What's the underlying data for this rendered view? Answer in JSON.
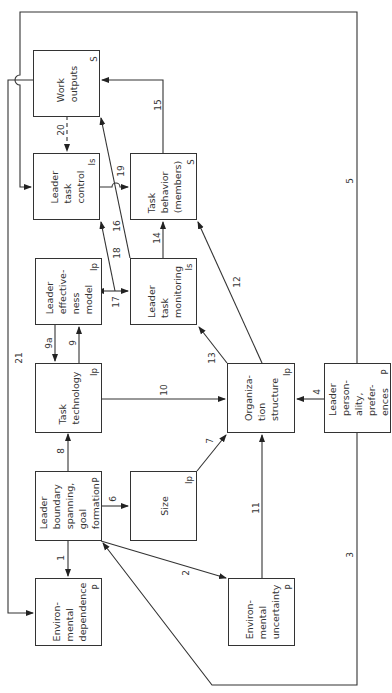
{
  "diagram": {
    "orientation": "rotated 90 degrees counter-clockwise (text reads bottom to top)",
    "nodes": [
      {
        "id": "work_outputs",
        "label": "Work\noutputs",
        "tag": "S"
      },
      {
        "id": "leader_task_control",
        "label": "Leader\ntask\ncontrol",
        "tag": "Is"
      },
      {
        "id": "task_behavior",
        "label": "Task\nbehavior\n(members)",
        "tag": "S"
      },
      {
        "id": "leader_effectiveness_model",
        "label": "Leader\neffective-\nness\nmodel",
        "tag": "Ip"
      },
      {
        "id": "leader_task_monitoring",
        "label": "Leader\ntask\nmonitoring",
        "tag": "Is"
      },
      {
        "id": "task_technology",
        "label": "Task\ntechnology",
        "tag": "Ip"
      },
      {
        "id": "organization_structure",
        "label": "Organiza-\ntion\nstructure",
        "tag": "Ip"
      },
      {
        "id": "leader_personality",
        "label": "Leader\nperson-\nality,\nprefer-\nences",
        "tag": "P"
      },
      {
        "id": "leader_boundary_spanning",
        "label": "Leader\nboundary\nspanning,\ngoal\nformation",
        "tag": "P"
      },
      {
        "id": "size",
        "label": "Size",
        "tag": "Ip"
      },
      {
        "id": "environmental_dependence",
        "label": "Environ-\nmental\ndependence",
        "tag": "P"
      },
      {
        "id": "environmental_uncertainty",
        "label": "Environ-\nmental\nuncertainty",
        "tag": "P"
      }
    ],
    "edges": [
      {
        "num": "1",
        "from": "leader_boundary_spanning",
        "to": "environmental_dependence"
      },
      {
        "num": "2",
        "from": "leader_boundary_spanning",
        "to": "environmental_uncertainty"
      },
      {
        "num": "3",
        "from": "leader_personality",
        "to": "leader_boundary_spanning"
      },
      {
        "num": "4",
        "from": "leader_personality",
        "to": "organization_structure"
      },
      {
        "num": "5",
        "from": "leader_personality",
        "to": "leader_task_control"
      },
      {
        "num": "6",
        "from": "leader_boundary_spanning",
        "to": "size"
      },
      {
        "num": "7",
        "from": "size",
        "to": "organization_structure"
      },
      {
        "num": "8",
        "from": "leader_boundary_spanning",
        "to": "task_technology"
      },
      {
        "num": "9",
        "from": "task_technology",
        "to": "leader_effectiveness_model"
      },
      {
        "num": "9a",
        "from": "leader_effectiveness_model",
        "to": "task_technology"
      },
      {
        "num": "10",
        "from": "task_technology",
        "to": "organization_structure"
      },
      {
        "num": "11",
        "from": "environmental_uncertainty",
        "to": "organization_structure"
      },
      {
        "num": "12",
        "from": "organization_structure",
        "to": "task_behavior"
      },
      {
        "num": "13",
        "from": "organization_structure",
        "to": "leader_task_monitoring"
      },
      {
        "num": "14",
        "from": "leader_task_monitoring",
        "to": "task_behavior"
      },
      {
        "num": "15",
        "from": "task_behavior",
        "to": "work_outputs"
      },
      {
        "num": "16",
        "from": "leader_task_monitoring",
        "to": "work_outputs"
      },
      {
        "num": "17",
        "from": "leader_effectiveness_model",
        "to": "leader_task_monitoring",
        "bidirectional": true
      },
      {
        "num": "18",
        "from": "leader_task_monitoring",
        "to": "leader_task_control"
      },
      {
        "num": "19",
        "from": "leader_task_control",
        "to": "task_behavior"
      },
      {
        "num": "20",
        "from": "work_outputs",
        "to": "leader_task_control",
        "dashed": true
      },
      {
        "num": "21",
        "from": "work_outputs",
        "to": "environmental_dependence"
      }
    ]
  },
  "labels": {
    "work_outputs": "Work\noutputs",
    "work_outputs_tag": "S",
    "leader_task_control": "Leader\ntask\ncontrol",
    "leader_task_control_tag": "Is",
    "task_behavior": "Task\nbehavior\n(members)",
    "task_behavior_tag": "S",
    "leader_effectiveness_model": "Leader\neffective-\nness\nmodel",
    "leader_effectiveness_model_tag": "Ip",
    "leader_task_monitoring": "Leader\ntask\nmonitoring",
    "leader_task_monitoring_tag": "Is",
    "task_technology": "Task\ntechnology",
    "task_technology_tag": "Ip",
    "organization_structure": "Organiza-\ntion\nstructure",
    "organization_structure_tag": "Ip",
    "leader_personality": "Leader\nperson-\nality,\nprefer-\nences",
    "leader_personality_tag": "P",
    "leader_boundary_spanning": "Leader\nboundary\nspanning,\ngoal\nformation",
    "leader_boundary_spanning_tag": "P",
    "size": "Size",
    "size_tag": "Ip",
    "environmental_dependence": "Environ-\nmental\ndependence",
    "environmental_dependence_tag": "P",
    "environmental_uncertainty": "Environ-\nmental\nuncertainty",
    "environmental_uncertainty_tag": "P"
  },
  "edge_numbers": {
    "e1": "1",
    "e2": "2",
    "e3": "3",
    "e4": "4",
    "e5": "5",
    "e6": "6",
    "e7": "7",
    "e8": "8",
    "e9": "9",
    "e9a": "9a",
    "e10": "10",
    "e11": "11",
    "e12": "12",
    "e13": "13",
    "e14": "14",
    "e15": "15",
    "e16": "16",
    "e17": "17",
    "e18": "18",
    "e19": "19",
    "e20": "20",
    "e21": "21"
  }
}
